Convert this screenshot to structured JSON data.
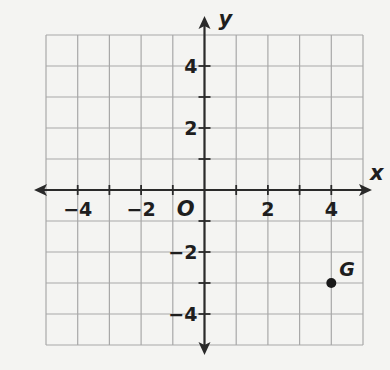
{
  "chart_data": {
    "type": "scatter",
    "title": "",
    "xlabel": "x",
    "ylabel": "y",
    "origin_label": "O",
    "xlim": [
      -5,
      5
    ],
    "ylim": [
      -5,
      5
    ],
    "grid": true,
    "grid_step": 1,
    "x_ticks": [
      -4,
      -2,
      2,
      4
    ],
    "y_ticks": [
      4,
      2,
      -2,
      -4
    ],
    "x_tick_labels": [
      "−4",
      "−2",
      "2",
      "4"
    ],
    "y_tick_labels": [
      "4",
      "2",
      "−2",
      "−4"
    ],
    "points": [
      {
        "label": "G",
        "x": 4,
        "y": -3
      }
    ]
  }
}
